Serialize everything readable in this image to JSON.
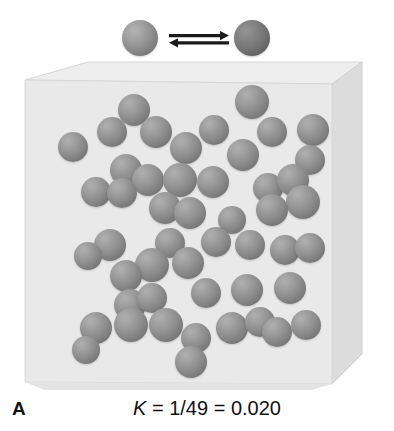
{
  "figure": {
    "panel_letter": "A",
    "equation": "K = 1/49 = 0.020",
    "equation_symbol": "K",
    "equation_rest": " = 1/49 = 0.020",
    "background_color": "#ffffff"
  },
  "reaction": {
    "name": "equilibrium-reaction",
    "arrow_icon": "equilibrium-double-harpoon-icon",
    "reactant": {
      "icon": "reactant-sphere-icon",
      "color": "#8e8e8e",
      "diameter_px": 36
    },
    "product": {
      "icon": "product-sphere-icon",
      "color": "#757575",
      "diameter_px": 36
    }
  },
  "container": {
    "name": "reaction-vessel-cube",
    "front_face_color": "#e9e9e9",
    "top_face_color": "#efefef",
    "right_face_color": "#dcdcdc",
    "edge_color": "#cfcfcf"
  },
  "chart_data": {
    "type": "scatter",
    "title": "K = 1/49 = 0.020",
    "subtitle": "A",
    "xlabel": "",
    "ylabel": "",
    "xlim": [
      0,
      394
    ],
    "ylim": [
      0,
      330
    ],
    "grid": false,
    "legend_position": "top",
    "annotations": [
      {
        "text": "A",
        "x": 12,
        "y": 398
      },
      {
        "text": "K = 1/49 = 0.020",
        "x": 197,
        "y": 412
      }
    ],
    "series": [
      {
        "name": "reactant-particles",
        "color": "#8e8e8e",
        "count": 49,
        "marker": "sphere",
        "points": [
          {
            "x": 134,
            "y": 50,
            "r": 16
          },
          {
            "x": 112,
            "y": 72,
            "r": 15
          },
          {
            "x": 156,
            "y": 72,
            "r": 16
          },
          {
            "x": 73,
            "y": 87,
            "r": 15
          },
          {
            "x": 214,
            "y": 70,
            "r": 15
          },
          {
            "x": 252,
            "y": 42,
            "r": 17
          },
          {
            "x": 272,
            "y": 72,
            "r": 15
          },
          {
            "x": 313,
            "y": 70,
            "r": 16
          },
          {
            "x": 186,
            "y": 88,
            "r": 16
          },
          {
            "x": 126,
            "y": 110,
            "r": 16
          },
          {
            "x": 148,
            "y": 120,
            "r": 16
          },
          {
            "x": 243,
            "y": 95,
            "r": 16
          },
          {
            "x": 310,
            "y": 100,
            "r": 15
          },
          {
            "x": 96,
            "y": 132,
            "r": 15
          },
          {
            "x": 122,
            "y": 133,
            "r": 15
          },
          {
            "x": 180,
            "y": 120,
            "r": 17
          },
          {
            "x": 213,
            "y": 122,
            "r": 16
          },
          {
            "x": 268,
            "y": 128,
            "r": 15
          },
          {
            "x": 293,
            "y": 120,
            "r": 16
          },
          {
            "x": 303,
            "y": 142,
            "r": 17
          },
          {
            "x": 165,
            "y": 148,
            "r": 16
          },
          {
            "x": 190,
            "y": 153,
            "r": 16
          },
          {
            "x": 272,
            "y": 150,
            "r": 16
          },
          {
            "x": 232,
            "y": 160,
            "r": 14
          },
          {
            "x": 110,
            "y": 185,
            "r": 16
          },
          {
            "x": 88,
            "y": 196,
            "r": 14
          },
          {
            "x": 170,
            "y": 183,
            "r": 15
          },
          {
            "x": 216,
            "y": 182,
            "r": 15
          },
          {
            "x": 250,
            "y": 185,
            "r": 15
          },
          {
            "x": 285,
            "y": 190,
            "r": 15
          },
          {
            "x": 310,
            "y": 188,
            "r": 15
          },
          {
            "x": 152,
            "y": 205,
            "r": 17
          },
          {
            "x": 188,
            "y": 203,
            "r": 16
          },
          {
            "x": 126,
            "y": 216,
            "r": 16
          },
          {
            "x": 130,
            "y": 245,
            "r": 16
          },
          {
            "x": 152,
            "y": 238,
            "r": 15
          },
          {
            "x": 206,
            "y": 233,
            "r": 15
          },
          {
            "x": 247,
            "y": 230,
            "r": 16
          },
          {
            "x": 290,
            "y": 228,
            "r": 16
          },
          {
            "x": 96,
            "y": 268,
            "r": 16
          },
          {
            "x": 131,
            "y": 265,
            "r": 17
          },
          {
            "x": 166,
            "y": 265,
            "r": 17
          },
          {
            "x": 86,
            "y": 290,
            "r": 14
          },
          {
            "x": 196,
            "y": 278,
            "r": 15
          },
          {
            "x": 232,
            "y": 268,
            "r": 16
          },
          {
            "x": 260,
            "y": 262,
            "r": 15
          },
          {
            "x": 277,
            "y": 272,
            "r": 15
          },
          {
            "x": 306,
            "y": 265,
            "r": 15
          },
          {
            "x": 191,
            "y": 302,
            "r": 16
          }
        ]
      }
    ]
  }
}
